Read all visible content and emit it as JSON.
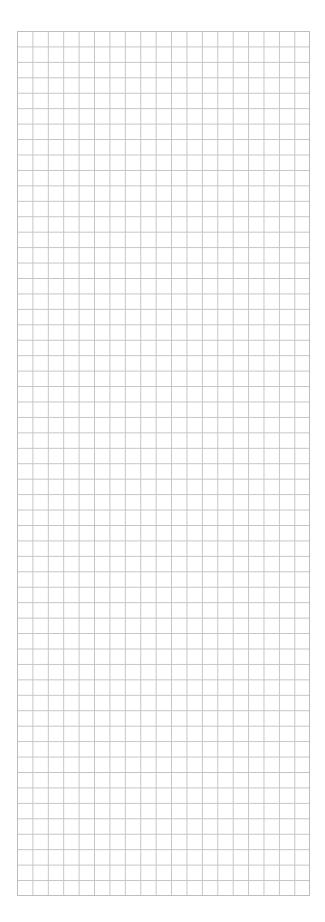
{
  "page": {
    "type": "graph-paper",
    "background_color": "#ffffff",
    "grid_line_color": "#c4c4c4",
    "columns": 19,
    "rows": 56
  }
}
